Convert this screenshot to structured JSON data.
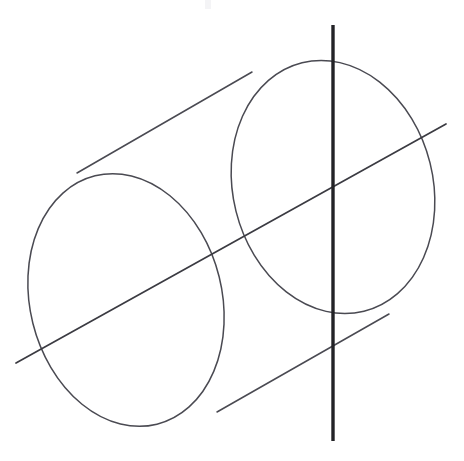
{
  "figure": {
    "kind": "line-drawing",
    "background_color": "#ffffff",
    "canvas": {
      "width": 464,
      "height": 461
    },
    "stroke_colors": {
      "outline": "#4a4a52",
      "oblique_line": "#3b3b42",
      "vertical_line": "#232327"
    },
    "elements": {
      "front_ellipse": {
        "name": "near-end cap ellipse",
        "center": [
          126,
          300
        ],
        "radius_x": 96,
        "radius_y": 128,
        "rotation_deg": -14,
        "bounds": [
          30,
          172,
          222,
          428
        ]
      },
      "back_ellipse": {
        "name": "far-end cap ellipse",
        "center": [
          333,
          187
        ],
        "radius_x": 100,
        "radius_y": 128,
        "rotation_deg": -14,
        "bounds": [
          233,
          60,
          432,
          315
        ]
      },
      "upper_silhouette": {
        "name": "upper generating line",
        "from": [
          77,
          173
        ],
        "to": [
          252,
          72
        ]
      },
      "lower_silhouette": {
        "name": "lower generating line",
        "from": [
          217,
          412
        ],
        "to": [
          389,
          314
        ]
      },
      "vertical_line": {
        "name": "vertical axis line",
        "from": [
          333,
          25
        ],
        "to": [
          333,
          441
        ],
        "x": 333
      },
      "oblique_line": {
        "name": "oblique axis line",
        "from": [
          16,
          363
        ],
        "to": [
          446,
          124
        ]
      }
    },
    "labels": []
  }
}
